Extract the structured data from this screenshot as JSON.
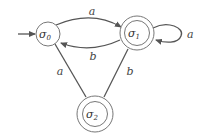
{
  "diagram": {
    "type": "finite-state-automaton",
    "states": [
      {
        "id": "s0",
        "symbol": "σ",
        "subscript": "0",
        "start": true,
        "accepting": false
      },
      {
        "id": "s1",
        "symbol": "σ",
        "subscript": "1",
        "start": false,
        "accepting": true
      },
      {
        "id": "s2",
        "symbol": "σ",
        "subscript": "2",
        "start": false,
        "accepting": true
      }
    ],
    "transitions": [
      {
        "from": "s0",
        "to": "s1",
        "label": "a"
      },
      {
        "from": "s1",
        "to": "s0",
        "label": "b"
      },
      {
        "from": "s1",
        "to": "s1",
        "label": "a"
      },
      {
        "from": "s0",
        "to": "s2",
        "label": "a"
      },
      {
        "from": "s1",
        "to": "s2",
        "label": "b"
      }
    ]
  }
}
